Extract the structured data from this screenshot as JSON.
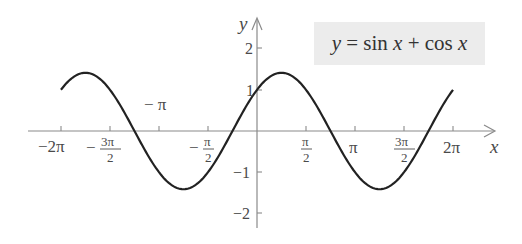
{
  "chart_data": {
    "type": "line",
    "title": "y = sin x + cos x",
    "xlabel": "x",
    "ylabel": "y",
    "xlim": [
      -6.2832,
      6.2832
    ],
    "ylim": [
      -2,
      2
    ],
    "grid": false,
    "legend": {
      "position": "top-right",
      "entries": [
        "y = sin x + cos x"
      ]
    },
    "x_ticks": [
      {
        "value": -6.2832,
        "label": "−2π"
      },
      {
        "value": -4.7124,
        "label": "−3π/2"
      },
      {
        "value": -3.1416,
        "label": "−π"
      },
      {
        "value": -1.5708,
        "label": "−π/2"
      },
      {
        "value": 1.5708,
        "label": "π/2"
      },
      {
        "value": 3.1416,
        "label": "π"
      },
      {
        "value": 4.7124,
        "label": "3π/2"
      },
      {
        "value": 6.2832,
        "label": "2π"
      }
    ],
    "y_ticks": [
      {
        "value": 2,
        "label": "2"
      },
      {
        "value": 1,
        "label": "1"
      },
      {
        "value": -1,
        "label": "−1"
      },
      {
        "value": -2,
        "label": "−2"
      }
    ],
    "series": [
      {
        "name": "y = sin x + cos x",
        "x": [
          -6.2832,
          -5.4978,
          -4.7124,
          -3.927,
          -3.1416,
          -2.3562,
          -1.5708,
          -0.7854,
          0,
          0.7854,
          1.5708,
          2.3562,
          3.1416,
          3.927,
          4.7124,
          5.4978,
          6.2832
        ],
        "values": [
          1,
          1.414,
          1,
          0,
          -1,
          -1.414,
          -1,
          0,
          1,
          1.414,
          1,
          0,
          -1,
          -1.414,
          -1,
          0,
          1
        ]
      }
    ]
  },
  "labels": {
    "legend_y": "y",
    "legend_eq": " = sin ",
    "legend_x1": "x",
    "legend_plus": " + cos ",
    "legend_x2": "x",
    "axis_x": "x",
    "axis_y": "y",
    "tick_neg2pi": "−2π",
    "tick_neg3pi2_num": "3π",
    "tick_neg3pi2_den": "2",
    "tick_negpi": "− π",
    "tick_negpi2_num": "π",
    "tick_negpi2_den": "2",
    "tick_pi2_num": "π",
    "tick_pi2_den": "2",
    "tick_pi": "π",
    "tick_3pi2_num": "3π",
    "tick_3pi2_den": "2",
    "tick_2pi": "2π",
    "tick_y2": "2",
    "tick_y1": "1",
    "tick_yn1": "−1",
    "tick_yn2": "−2"
  },
  "colors": {
    "curve": "#222222",
    "axis": "#777777",
    "legend_bg": "#ececec"
  }
}
